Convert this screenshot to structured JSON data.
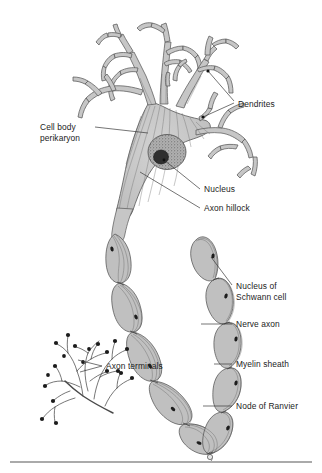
{
  "figure": {
    "background_color": "#ffffff",
    "ink_color": "#3a3a3a",
    "cytoplasm_fill": "#c9c9c9",
    "nucleus_fill": "#9a9a9a",
    "nucleolus_fill": "#2b2b2b",
    "myelin_fill": "#bdbdbd",
    "text_color": "#1c1c1c"
  },
  "labels": {
    "dendrites": "Dendrites",
    "cell_body_line1": "Cell body",
    "cell_body_line2": "perikaryon",
    "nucleus": "Nucleus",
    "axon_hillock": "Axon hillock",
    "nucleus_schwann_line1": "Nucleus of",
    "nucleus_schwann_line2": "Schwann cell",
    "nerve_axon": "Nerve axon",
    "myelin_sheath": "Myelin sheath",
    "node_of_ranvier": "Node of Ranvier",
    "axon_terminals": "Axon terminals"
  },
  "parts": [
    {
      "id": "dendrites",
      "name": "Dendrites",
      "label_x": 238,
      "label_y": 104
    },
    {
      "id": "cell-body",
      "name": "Cell body perikaryon",
      "label_x": 40,
      "label_y": 131
    },
    {
      "id": "nucleus",
      "name": "Nucleus",
      "label_x": 203,
      "label_y": 192
    },
    {
      "id": "axon-hillock",
      "name": "Axon hillock",
      "label_x": 203,
      "label_y": 211
    },
    {
      "id": "schwann-nucleus",
      "name": "Nucleus of Schwann cell",
      "label_x": 235,
      "label_y": 292
    },
    {
      "id": "nerve-axon",
      "name": "Nerve axon",
      "label_x": 235,
      "label_y": 327
    },
    {
      "id": "myelin-sheath",
      "name": "Myelin sheath",
      "label_x": 235,
      "label_y": 367
    },
    {
      "id": "node-of-ranvier",
      "name": "Node of Ranvier",
      "label_x": 235,
      "label_y": 409
    },
    {
      "id": "axon-terminals",
      "name": "Axon terminals",
      "label_x": 106,
      "label_y": 368
    }
  ],
  "footer_rule": {
    "x1": 10,
    "y1": 462,
    "x2": 312,
    "y2": 462
  }
}
